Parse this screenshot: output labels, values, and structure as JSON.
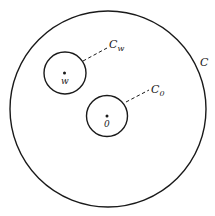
{
  "diagram": {
    "outer_circle": {
      "label": "C",
      "cx": 108,
      "cy": 109,
      "r": 98
    },
    "circle_w": {
      "label_main": "C",
      "label_sub": "w",
      "point_label": "w",
      "cx": 65,
      "cy": 73,
      "r": 21
    },
    "circle_0": {
      "label_main": "C",
      "label_sub": "0",
      "point_label": "0",
      "cx": 107,
      "cy": 116,
      "r": 20
    },
    "colors": {
      "stroke": "#1a1a1a",
      "background": "#ffffff"
    }
  }
}
